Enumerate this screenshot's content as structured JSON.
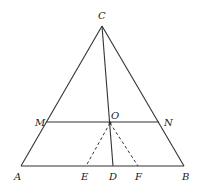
{
  "diagram": {
    "type": "geometry",
    "points": {
      "A": {
        "label": "A",
        "x": 21,
        "y": 166,
        "lx": 14,
        "ly": 180
      },
      "B": {
        "label": "B",
        "x": 184,
        "y": 166,
        "lx": 182,
        "ly": 180
      },
      "C": {
        "label": "C",
        "x": 102,
        "y": 26,
        "lx": 98,
        "ly": 19
      },
      "M": {
        "label": "M",
        "x": 46,
        "y": 122,
        "lx": 35,
        "ly": 126
      },
      "N": {
        "label": "N",
        "x": 159,
        "y": 122,
        "lx": 164,
        "ly": 126
      },
      "O": {
        "label": "O",
        "x": 110,
        "y": 123,
        "lx": 111,
        "ly": 119
      },
      "D": {
        "label": "D",
        "x": 113,
        "y": 166,
        "lx": 109,
        "ly": 180
      },
      "E": {
        "label": "E",
        "x": 86,
        "y": 166,
        "lx": 81,
        "ly": 180
      },
      "F": {
        "label": "F",
        "x": 138,
        "y": 166,
        "lx": 135,
        "ly": 180
      }
    },
    "solid_segments": [
      [
        "A",
        "B"
      ],
      [
        "A",
        "C"
      ],
      [
        "B",
        "C"
      ],
      [
        "M",
        "N"
      ],
      [
        "C",
        "D"
      ]
    ],
    "dashed_segments": [
      [
        "O",
        "E"
      ],
      [
        "O",
        "F"
      ]
    ],
    "colors": {
      "stroke": "#333333",
      "label": "#222222",
      "background": "#ffffff"
    }
  }
}
